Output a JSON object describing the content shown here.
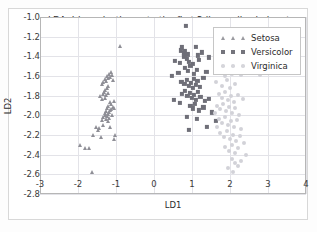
{
  "chart_data": {
    "type": "scatter",
    "title": "LDA: Iris projection onto the first 2 linear discriminants",
    "xlabel": "LD1",
    "ylabel": "LD2",
    "xlim": [
      -3,
      4
    ],
    "ylim": [
      -2.8,
      -1.0
    ],
    "xticks": [
      "-3",
      "-2",
      "-1",
      "0",
      "1",
      "2",
      "3",
      "4"
    ],
    "xtick_values": [
      -3,
      -2,
      -1,
      0,
      1,
      2,
      3,
      4
    ],
    "yticks": [
      "-1.0",
      "-1.2",
      "-1.4",
      "-1.6",
      "-1.8",
      "-2.0",
      "-2.2",
      "-2.4",
      "-2.6",
      "-2.8"
    ],
    "ytick_values": [
      -1.0,
      -1.2,
      -1.4,
      -1.6,
      -1.8,
      -2.0,
      -2.2,
      -2.4,
      -2.6,
      -2.8
    ],
    "grid": true,
    "legend_position": "upper right",
    "series": [
      {
        "name": "Setosa",
        "marker": "triangle",
        "color": "#8f8f96",
        "points": [
          [
            -1.95,
            -2.3
          ],
          [
            -1.82,
            -2.33
          ],
          [
            -1.7,
            -2.33
          ],
          [
            -1.62,
            -2.58
          ],
          [
            -1.6,
            -2.2
          ],
          [
            -1.52,
            -2.12
          ],
          [
            -1.48,
            -2.15
          ],
          [
            -1.44,
            -2.13
          ],
          [
            -1.4,
            -2.22
          ],
          [
            -1.36,
            -2.05
          ],
          [
            -1.34,
            -2.1
          ],
          [
            -1.33,
            -2.02
          ],
          [
            -1.3,
            -1.98
          ],
          [
            -1.28,
            -2.0
          ],
          [
            -1.27,
            -2.04
          ],
          [
            -1.26,
            -1.96
          ],
          [
            -1.25,
            -2.01
          ],
          [
            -1.24,
            -1.93
          ],
          [
            -1.22,
            -1.99
          ],
          [
            -1.21,
            -2.06
          ],
          [
            -1.2,
            -1.9
          ],
          [
            -1.19,
            -1.97
          ],
          [
            -1.18,
            -2.03
          ],
          [
            -1.17,
            -1.86
          ],
          [
            -1.16,
            -1.95
          ],
          [
            -1.15,
            -2.12
          ],
          [
            -1.14,
            -1.88
          ],
          [
            -1.12,
            -1.94
          ],
          [
            -1.1,
            -2.0
          ],
          [
            -1.08,
            -1.92
          ],
          [
            -1.06,
            -2.24
          ],
          [
            -1.05,
            -1.85
          ],
          [
            -1.42,
            -1.8
          ],
          [
            -1.38,
            -1.83
          ],
          [
            -1.35,
            -1.78
          ],
          [
            -1.32,
            -1.76
          ],
          [
            -1.3,
            -1.82
          ],
          [
            -1.28,
            -1.74
          ],
          [
            -1.26,
            -1.79
          ],
          [
            -1.24,
            -1.72
          ],
          [
            -1.22,
            -1.77
          ],
          [
            -1.2,
            -1.7
          ],
          [
            -1.36,
            -1.68
          ],
          [
            -1.33,
            -1.66
          ],
          [
            -1.3,
            -1.63
          ],
          [
            -1.27,
            -1.65
          ],
          [
            -1.25,
            -1.6
          ],
          [
            -1.22,
            -1.62
          ],
          [
            -1.19,
            -1.58
          ],
          [
            -1.16,
            -1.61
          ],
          [
            -1.13,
            -1.56
          ],
          [
            -1.1,
            -1.59
          ],
          [
            -1.07,
            -1.64
          ],
          [
            -1.04,
            -1.93
          ],
          [
            -1.02,
            -2.2
          ],
          [
            -0.9,
            -1.29
          ]
        ]
      },
      {
        "name": "Versicolor",
        "marker": "square",
        "color": "#6f6f78",
        "points": [
          [
            0.84,
            -1.09
          ],
          [
            0.7,
            -1.34
          ],
          [
            0.74,
            -1.31
          ],
          [
            0.78,
            -1.37
          ],
          [
            0.8,
            -1.4
          ],
          [
            0.82,
            -1.35
          ],
          [
            0.86,
            -1.43
          ],
          [
            0.88,
            -1.38
          ],
          [
            1.1,
            -1.3
          ],
          [
            1.15,
            -1.39
          ],
          [
            1.18,
            -1.44
          ],
          [
            1.26,
            -1.36
          ],
          [
            1.45,
            -1.41
          ],
          [
            0.56,
            -1.45
          ],
          [
            0.68,
            -1.47
          ],
          [
            0.92,
            -1.46
          ],
          [
            1.02,
            -1.48
          ],
          [
            0.48,
            -1.6
          ],
          [
            0.64,
            -1.57
          ],
          [
            0.82,
            -1.52
          ],
          [
            0.9,
            -1.55
          ],
          [
            0.96,
            -1.5
          ],
          [
            1.04,
            -1.58
          ],
          [
            1.12,
            -1.54
          ],
          [
            1.3,
            -1.62
          ],
          [
            1.38,
            -1.56
          ],
          [
            0.72,
            -1.66
          ],
          [
            0.8,
            -1.68
          ],
          [
            0.86,
            -1.64
          ],
          [
            0.92,
            -1.7
          ],
          [
            0.98,
            -1.67
          ],
          [
            1.02,
            -1.72
          ],
          [
            1.06,
            -1.63
          ],
          [
            1.1,
            -1.69
          ],
          [
            1.14,
            -1.65
          ],
          [
            1.2,
            -1.71
          ],
          [
            0.74,
            -1.78
          ],
          [
            0.82,
            -1.75
          ],
          [
            0.88,
            -1.8
          ],
          [
            0.94,
            -1.77
          ],
          [
            1.0,
            -1.82
          ],
          [
            1.05,
            -1.79
          ],
          [
            1.1,
            -1.84
          ],
          [
            1.16,
            -1.76
          ],
          [
            1.22,
            -1.81
          ],
          [
            0.52,
            -1.84
          ],
          [
            0.68,
            -1.87
          ],
          [
            1.34,
            -1.85
          ],
          [
            1.44,
            -1.83
          ],
          [
            0.96,
            -1.9
          ],
          [
            1.02,
            -1.93
          ],
          [
            1.08,
            -1.88
          ],
          [
            1.18,
            -1.95
          ],
          [
            1.3,
            -1.92
          ],
          [
            0.86,
            -2.02
          ],
          [
            1.12,
            -2.04
          ],
          [
            1.52,
            -1.97
          ],
          [
            0.92,
            -2.15
          ],
          [
            1.4,
            -2.12
          ],
          [
            1.62,
            -2.06
          ]
        ]
      },
      {
        "name": "Virginica",
        "marker": "circle",
        "color": "#d2d2d8",
        "points": [
          [
            1.72,
            -1.56
          ],
          [
            1.88,
            -1.6
          ],
          [
            2.06,
            -1.58
          ],
          [
            2.3,
            -1.59
          ],
          [
            2.78,
            -1.59
          ],
          [
            1.62,
            -1.66
          ],
          [
            1.8,
            -1.7
          ],
          [
            1.92,
            -1.64
          ],
          [
            2.0,
            -1.72
          ],
          [
            2.12,
            -1.68
          ],
          [
            1.7,
            -1.78
          ],
          [
            1.78,
            -1.82
          ],
          [
            1.86,
            -1.76
          ],
          [
            1.94,
            -1.84
          ],
          [
            2.02,
            -1.8
          ],
          [
            2.1,
            -1.86
          ],
          [
            2.2,
            -1.79
          ],
          [
            1.66,
            -1.9
          ],
          [
            1.74,
            -1.94
          ],
          [
            1.82,
            -1.88
          ],
          [
            1.9,
            -1.96
          ],
          [
            1.98,
            -1.92
          ],
          [
            2.06,
            -1.98
          ],
          [
            2.14,
            -1.93
          ],
          [
            2.24,
            -2.0
          ],
          [
            2.34,
            -1.83
          ],
          [
            1.7,
            -2.04
          ],
          [
            1.78,
            -2.08
          ],
          [
            1.86,
            -2.02
          ],
          [
            1.94,
            -2.1
          ],
          [
            2.02,
            -2.06
          ],
          [
            2.1,
            -2.12
          ],
          [
            2.18,
            -2.05
          ],
          [
            2.28,
            -2.14
          ],
          [
            1.74,
            -2.18
          ],
          [
            1.84,
            -2.22
          ],
          [
            1.92,
            -2.16
          ],
          [
            2.0,
            -2.24
          ],
          [
            2.08,
            -2.2
          ],
          [
            2.16,
            -2.26
          ],
          [
            2.26,
            -2.21
          ],
          [
            2.36,
            -2.28
          ],
          [
            1.88,
            -2.32
          ],
          [
            1.98,
            -2.36
          ],
          [
            2.06,
            -2.3
          ],
          [
            2.14,
            -2.38
          ],
          [
            2.22,
            -2.33
          ],
          [
            2.42,
            -2.4
          ],
          [
            2.04,
            -2.44
          ],
          [
            2.12,
            -2.48
          ],
          [
            2.2,
            -2.52
          ],
          [
            1.96,
            -2.54
          ],
          [
            2.08,
            -2.58
          ],
          [
            2.3,
            -2.46
          ],
          [
            1.66,
            -2.12
          ],
          [
            1.6,
            -1.98
          ]
        ]
      }
    ]
  }
}
